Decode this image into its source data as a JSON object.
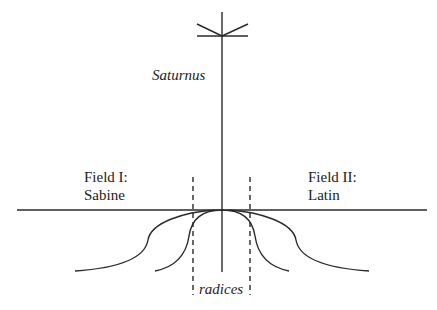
{
  "diagram": {
    "labels": {
      "top_axis": "Saturnus",
      "left_field_line1": "Field I:",
      "left_field_line2": "Sabine",
      "right_field_line1": "Field II:",
      "right_field_line2": "Latin",
      "bottom": "radices"
    },
    "colors": {
      "line": "#2a2a2a",
      "text": "#222222",
      "background": "#ffffff"
    }
  }
}
